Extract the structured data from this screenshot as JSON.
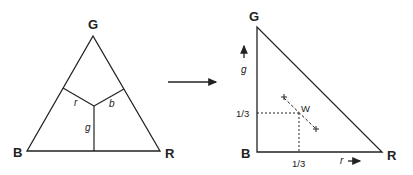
{
  "left_triangle": {
    "vertices": {
      "top": "G",
      "bottom_left": "B",
      "bottom_right": "R"
    },
    "region_labels": {
      "left": "r",
      "right": "b",
      "bottom": "g"
    }
  },
  "transform_arrow": {
    "direction": "right"
  },
  "right_triangle": {
    "vertices": {
      "top": "G",
      "bottom_left": "B",
      "bottom_right": "R"
    },
    "axes": {
      "vertical": "g",
      "horizontal": "r"
    },
    "white_point": {
      "label": "W",
      "x_tick": "1/3",
      "y_tick": "1/3"
    }
  }
}
